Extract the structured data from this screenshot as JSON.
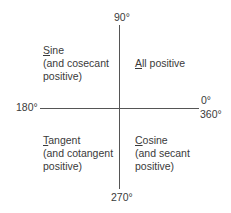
{
  "axes": {
    "top": "90°",
    "left": "180°",
    "right_top": "0°",
    "right_bottom": "360°",
    "bottom": "270°"
  },
  "quadrants": {
    "q1": {
      "first_letter": "A",
      "rest": "ll positive",
      "lines": []
    },
    "q2": {
      "first_letter": "S",
      "rest": "ine",
      "lines": [
        "(and cosecant",
        "positive)"
      ]
    },
    "q3": {
      "first_letter": "T",
      "rest": "angent",
      "lines": [
        "(and cotangent",
        "positive)"
      ]
    },
    "q4": {
      "first_letter": "C",
      "rest": "osine",
      "lines": [
        "(and secant",
        "positive)"
      ]
    }
  },
  "colors": {
    "line": "#555555",
    "text": "#3a3a3a",
    "background": "#ffffff"
  }
}
